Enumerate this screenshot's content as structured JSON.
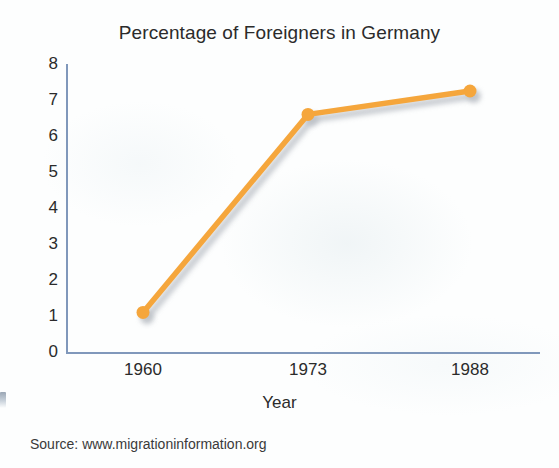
{
  "chart_data": {
    "type": "line",
    "title": "Percentage of Foreigners in Germany",
    "xlabel": "Year",
    "ylabel": "",
    "categories": [
      "1960",
      "1973",
      "1988"
    ],
    "x": [
      1960,
      1973,
      1988
    ],
    "values": [
      1.1,
      6.6,
      7.25
    ],
    "series": [
      {
        "name": "Percentage of foreigners",
        "values": [
          1.1,
          6.6,
          7.25
        ]
      }
    ],
    "ylim": [
      0,
      8
    ],
    "yticks": [
      "0",
      "1",
      "2",
      "3",
      "4",
      "5",
      "6",
      "7",
      "8"
    ],
    "xticks": [
      "1960",
      "1973",
      "1988"
    ],
    "grid": false,
    "legend": "none",
    "line_color": "#F5A63C",
    "marker_color": "#F5A63C",
    "axis_color": "#8098bb",
    "shadow_color": "#b9bec4",
    "source": "Source: www.migrationinformation.org"
  },
  "axes": {
    "y_tick_labels": [
      "8",
      "7",
      "6",
      "5",
      "4",
      "3",
      "2",
      "1",
      "0"
    ],
    "x_tick_labels": [
      "1960",
      "1973",
      "1988"
    ],
    "x_title": "Year"
  },
  "footer": {
    "source_text": "Source: www.migrationinformation.org"
  }
}
